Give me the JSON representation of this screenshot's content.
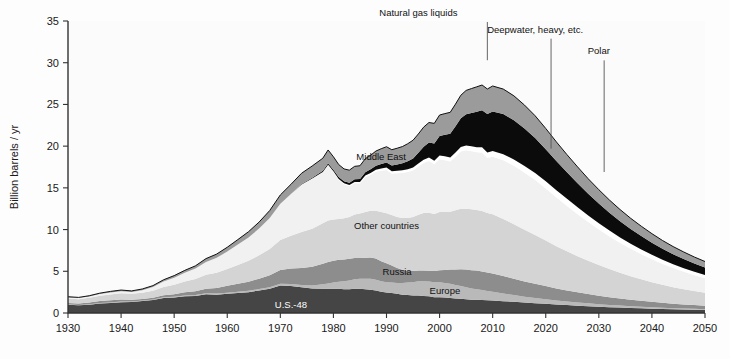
{
  "figure": {
    "title_caption": "",
    "plot_bg": "#fbfbfb"
  },
  "axes": {
    "y_title": "Billion barrels / yr",
    "y_ticks": [
      0,
      5,
      10,
      15,
      20,
      25,
      30,
      35
    ],
    "y_min": 0,
    "y_max": 35,
    "x_ticks": [
      1930,
      1940,
      1950,
      1960,
      1970,
      1980,
      1990,
      2000,
      2010,
      2020,
      2030,
      2040,
      2050
    ],
    "x_min": 1930,
    "x_max": 2050,
    "grid": false
  },
  "layer_labels": [
    {
      "name": "us-48",
      "text": "U.S.-48",
      "x": 1972,
      "y": 0.55,
      "light": true
    },
    {
      "name": "europe",
      "text": "Europe",
      "x": 2001,
      "y": 2.25,
      "light": false
    },
    {
      "name": "russia",
      "text": "Russia",
      "x": 1992,
      "y": 4.55,
      "light": false
    },
    {
      "name": "other-countries",
      "text": "Other countries",
      "x": 1990,
      "y": 10.1,
      "light": false
    },
    {
      "name": "middle-east",
      "text": "Middle East",
      "x": 1989,
      "y": 18.3,
      "light": false
    }
  ],
  "callouts": [
    {
      "name": "natural-gas-liquids",
      "text": "Natural gas liquids",
      "label_x": 1996,
      "label_y": 35.6,
      "tip_x": 2009,
      "tip_y": 30.3,
      "anchor": "middle"
    },
    {
      "name": "deepwater-heavy",
      "text": "Deepwater, heavy, etc.",
      "label_x": 2018,
      "label_y": 33.6,
      "tip_x": 2021,
      "tip_y": 19.7,
      "anchor": "middle"
    },
    {
      "name": "polar",
      "text": "Polar",
      "label_x": 2030,
      "label_y": 31.0,
      "tip_x": 2031,
      "tip_y": 16.9,
      "anchor": "middle"
    }
  ],
  "chart_data": {
    "type": "area",
    "xlabel": "",
    "ylabel": "Billion barrels / yr",
    "xlim": [
      1930,
      2050
    ],
    "ylim": [
      0,
      35
    ],
    "grid": false,
    "legend_position": "inline-labels",
    "stacking": "stacked",
    "units": "billion barrels per year",
    "x": [
      1930,
      1932,
      1934,
      1936,
      1938,
      1940,
      1942,
      1944,
      1946,
      1948,
      1950,
      1952,
      1954,
      1956,
      1958,
      1960,
      1962,
      1964,
      1966,
      1968,
      1970,
      1972,
      1974,
      1976,
      1978,
      1979,
      1980,
      1981,
      1982,
      1983,
      1984,
      1985,
      1986,
      1987,
      1988,
      1989,
      1990,
      1991,
      1992,
      1993,
      1994,
      1995,
      1996,
      1997,
      1998,
      1999,
      2000,
      2001,
      2002,
      2003,
      2004,
      2005,
      2006,
      2007,
      2008,
      2009,
      2010,
      2012,
      2014,
      2016,
      2018,
      2020,
      2022,
      2024,
      2026,
      2028,
      2030,
      2032,
      2034,
      2036,
      2038,
      2040,
      2042,
      2044,
      2046,
      2048,
      2050
    ],
    "colors": {
      "us_48": "#454545",
      "europe": "#b9b9b9",
      "russia": "#8d8d8d",
      "other_countries": "#d4d4d4",
      "middle_east": "#f1f1f1",
      "polar": "#ffffff",
      "deepwater_heavy": "#0b0b0b",
      "natural_gas_liquids": "#9b9b9b"
    },
    "series": [
      {
        "name": "U.S.-48",
        "key": "us_48",
        "color": "#454545",
        "values": [
          1.0,
          0.92,
          1.0,
          1.15,
          1.2,
          1.3,
          1.32,
          1.45,
          1.55,
          1.8,
          1.85,
          2.0,
          2.05,
          2.25,
          2.2,
          2.3,
          2.4,
          2.5,
          2.7,
          2.9,
          3.3,
          3.25,
          3.1,
          2.95,
          2.9,
          2.9,
          2.9,
          2.9,
          2.85,
          2.85,
          2.9,
          2.9,
          2.85,
          2.8,
          2.7,
          2.55,
          2.45,
          2.4,
          2.3,
          2.2,
          2.15,
          2.1,
          2.1,
          2.05,
          2.0,
          1.9,
          1.9,
          1.85,
          1.8,
          1.75,
          1.7,
          1.65,
          1.6,
          1.58,
          1.55,
          1.52,
          1.5,
          1.42,
          1.35,
          1.25,
          1.18,
          1.1,
          1.02,
          0.95,
          0.88,
          0.82,
          0.76,
          0.7,
          0.65,
          0.6,
          0.56,
          0.52,
          0.48,
          0.45,
          0.42,
          0.39,
          0.36
        ]
      },
      {
        "name": "Europe",
        "key": "europe",
        "color": "#b9b9b9",
        "values": [
          0.05,
          0.05,
          0.05,
          0.06,
          0.07,
          0.07,
          0.06,
          0.06,
          0.07,
          0.08,
          0.09,
          0.1,
          0.11,
          0.12,
          0.13,
          0.14,
          0.15,
          0.16,
          0.17,
          0.18,
          0.2,
          0.22,
          0.25,
          0.35,
          0.55,
          0.65,
          0.75,
          0.85,
          0.95,
          1.05,
          1.15,
          1.2,
          1.25,
          1.3,
          1.3,
          1.25,
          1.25,
          1.25,
          1.3,
          1.4,
          1.5,
          1.6,
          1.7,
          1.75,
          1.78,
          1.8,
          1.8,
          1.75,
          1.7,
          1.62,
          1.55,
          1.45,
          1.35,
          1.28,
          1.2,
          1.12,
          1.05,
          0.92,
          0.8,
          0.7,
          0.62,
          0.55,
          0.48,
          0.43,
          0.38,
          0.34,
          0.3,
          0.27,
          0.24,
          0.21,
          0.19,
          0.17,
          0.15,
          0.13,
          0.12,
          0.11,
          0.1
        ]
      },
      {
        "name": "Russia",
        "key": "russia",
        "color": "#8d8d8d",
        "values": [
          0.15,
          0.17,
          0.2,
          0.22,
          0.25,
          0.25,
          0.2,
          0.18,
          0.2,
          0.25,
          0.3,
          0.38,
          0.46,
          0.55,
          0.68,
          0.82,
          0.95,
          1.1,
          1.25,
          1.45,
          1.65,
          1.85,
          2.05,
          2.25,
          2.45,
          2.55,
          2.6,
          2.62,
          2.62,
          2.6,
          2.55,
          2.48,
          2.52,
          2.55,
          2.52,
          2.4,
          2.25,
          2.05,
          1.8,
          1.58,
          1.4,
          1.32,
          1.28,
          1.28,
          1.28,
          1.32,
          1.42,
          1.55,
          1.7,
          1.85,
          2.0,
          2.1,
          2.18,
          2.22,
          2.22,
          2.2,
          2.18,
          2.08,
          1.95,
          1.82,
          1.7,
          1.58,
          1.45,
          1.33,
          1.22,
          1.12,
          1.02,
          0.93,
          0.85,
          0.78,
          0.71,
          0.65,
          0.59,
          0.54,
          0.49,
          0.45,
          0.41
        ]
      },
      {
        "name": "Other countries",
        "key": "other_countries",
        "color": "#d4d4d4",
        "values": [
          0.55,
          0.52,
          0.58,
          0.65,
          0.7,
          0.75,
          0.72,
          0.75,
          0.85,
          1.0,
          1.15,
          1.3,
          1.45,
          1.65,
          1.8,
          2.0,
          2.25,
          2.5,
          2.8,
          3.15,
          3.6,
          3.95,
          4.3,
          4.55,
          4.85,
          5.0,
          4.95,
          4.9,
          4.95,
          5.0,
          5.2,
          5.35,
          5.5,
          5.6,
          5.75,
          5.9,
          6.0,
          6.05,
          6.1,
          6.2,
          6.35,
          6.5,
          6.7,
          6.9,
          6.95,
          6.85,
          7.0,
          7.0,
          6.95,
          7.1,
          7.25,
          7.3,
          7.3,
          7.28,
          7.25,
          7.15,
          7.1,
          6.85,
          6.55,
          6.2,
          5.85,
          5.45,
          5.05,
          4.68,
          4.32,
          3.98,
          3.66,
          3.36,
          3.08,
          2.82,
          2.58,
          2.36,
          2.16,
          1.98,
          1.82,
          1.68,
          1.55
        ]
      },
      {
        "name": "Middle East",
        "key": "middle_east",
        "color": "#f1f1f1",
        "values": [
          0.12,
          0.13,
          0.15,
          0.2,
          0.25,
          0.25,
          0.22,
          0.3,
          0.45,
          0.65,
          0.85,
          1.05,
          1.25,
          1.55,
          1.8,
          2.1,
          2.45,
          2.8,
          3.2,
          3.7,
          4.35,
          5.0,
          5.7,
          6.0,
          6.1,
          6.6,
          5.7,
          4.7,
          4.05,
          3.7,
          3.75,
          3.6,
          4.15,
          4.3,
          4.65,
          4.95,
          5.2,
          4.95,
          5.25,
          5.4,
          5.5,
          5.55,
          5.75,
          6.0,
          6.2,
          5.95,
          6.3,
          6.15,
          6.0,
          6.4,
          6.85,
          7.0,
          6.95,
          6.9,
          7.0,
          6.6,
          6.9,
          7.05,
          7.0,
          6.85,
          6.6,
          6.25,
          5.85,
          5.45,
          5.05,
          4.65,
          4.28,
          3.92,
          3.58,
          3.28,
          3.0,
          2.74,
          2.5,
          2.28,
          2.08,
          1.9,
          1.74
        ]
      },
      {
        "name": "Polar",
        "key": "polar",
        "color": "#ffffff",
        "values": [
          0,
          0,
          0,
          0,
          0,
          0,
          0,
          0,
          0,
          0,
          0,
          0,
          0,
          0,
          0,
          0,
          0,
          0,
          0,
          0,
          0,
          0,
          0,
          0.02,
          0.05,
          0.06,
          0.08,
          0.1,
          0.12,
          0.14,
          0.16,
          0.18,
          0.2,
          0.22,
          0.24,
          0.26,
          0.28,
          0.29,
          0.3,
          0.32,
          0.34,
          0.36,
          0.38,
          0.4,
          0.42,
          0.44,
          0.46,
          0.48,
          0.5,
          0.52,
          0.55,
          0.58,
          0.6,
          0.62,
          0.64,
          0.66,
          0.68,
          0.72,
          0.76,
          0.8,
          0.84,
          0.86,
          0.86,
          0.84,
          0.82,
          0.78,
          0.74,
          0.7,
          0.66,
          0.62,
          0.58,
          0.54,
          0.5,
          0.47,
          0.44,
          0.41,
          0.38
        ]
      },
      {
        "name": "Deepwater, heavy, etc.",
        "key": "deepwater_heavy",
        "color": "#0b0b0b",
        "values": [
          0,
          0,
          0,
          0,
          0,
          0,
          0,
          0,
          0,
          0,
          0,
          0,
          0,
          0,
          0,
          0,
          0,
          0,
          0,
          0,
          0,
          0,
          0.05,
          0.1,
          0.15,
          0.18,
          0.2,
          0.22,
          0.25,
          0.28,
          0.32,
          0.36,
          0.4,
          0.45,
          0.5,
          0.56,
          0.62,
          0.68,
          0.75,
          0.85,
          0.95,
          1.1,
          1.3,
          1.55,
          1.8,
          2.05,
          2.35,
          2.6,
          2.85,
          3.15,
          3.45,
          3.75,
          4.0,
          4.25,
          4.45,
          4.6,
          4.75,
          4.8,
          4.7,
          4.5,
          4.2,
          3.85,
          3.5,
          3.18,
          2.88,
          2.6,
          2.36,
          2.14,
          1.94,
          1.76,
          1.6,
          1.45,
          1.32,
          1.2,
          1.1,
          1.0,
          0.92
        ]
      },
      {
        "name": "Natural gas liquids",
        "key": "natural_gas_liquids",
        "color": "#9b9b9b",
        "values": [
          0.08,
          0.08,
          0.09,
          0.1,
          0.12,
          0.13,
          0.13,
          0.14,
          0.16,
          0.2,
          0.24,
          0.28,
          0.33,
          0.4,
          0.45,
          0.52,
          0.6,
          0.68,
          0.78,
          0.9,
          1.05,
          1.15,
          1.3,
          1.4,
          1.5,
          1.6,
          1.55,
          1.5,
          1.48,
          1.5,
          1.55,
          1.58,
          1.62,
          1.68,
          1.75,
          1.82,
          1.88,
          1.9,
          1.95,
          2.0,
          2.1,
          2.18,
          2.25,
          2.35,
          2.4,
          2.42,
          2.5,
          2.52,
          2.55,
          2.65,
          2.75,
          2.85,
          2.92,
          2.98,
          3.02,
          3.0,
          3.05,
          3.0,
          2.92,
          2.8,
          2.65,
          2.48,
          2.3,
          2.12,
          1.96,
          1.8,
          1.66,
          1.52,
          1.4,
          1.28,
          1.18,
          1.08,
          0.99,
          0.91,
          0.84,
          0.77,
          0.71
        ]
      }
    ],
    "total_outline_color": "#111111"
  }
}
